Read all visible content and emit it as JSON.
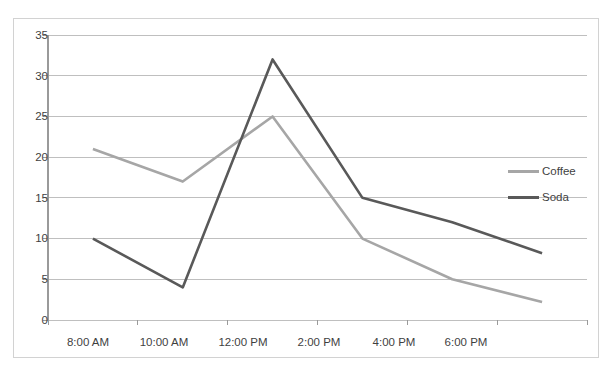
{
  "chart_data": {
    "type": "line",
    "title": "",
    "xlabel": "",
    "ylabel": "",
    "categories": [
      "8:00 AM",
      "10:00 AM",
      "12:00 PM",
      "2:00 PM",
      "4:00 PM",
      "6:00 PM"
    ],
    "series": [
      {
        "name": "Coffee",
        "color": "#a6a6a6",
        "values": [
          21,
          17,
          25,
          10,
          5,
          2.2
        ]
      },
      {
        "name": "Soda",
        "color": "#595959",
        "values": [
          10,
          4,
          32,
          15,
          12,
          8.2
        ]
      }
    ],
    "ylim": [
      0,
      35
    ],
    "yticks": [
      0,
      5,
      10,
      15,
      20,
      25,
      30,
      35
    ],
    "ytick_labels": [
      "0",
      "5",
      "10",
      "15",
      "20",
      "25",
      "30",
      "35"
    ],
    "grid": true,
    "grid_axis": "y",
    "grid_color": "#bfbfbf",
    "legend_position": "right",
    "background": "#ffffff",
    "border_color": "#d2d2d2",
    "tick_label_color": "#3f3f3f"
  },
  "legend": {
    "entries": [
      {
        "label": "Coffee"
      },
      {
        "label": "Soda"
      }
    ]
  },
  "axes": {
    "y_labels": [
      "35",
      "30",
      "25",
      "20",
      "15",
      "10",
      "5",
      "0"
    ],
    "x_labels": [
      "8:00 AM",
      "10:00 AM",
      "12:00 PM",
      "2:00 PM",
      "4:00 PM",
      "6:00 PM"
    ]
  }
}
